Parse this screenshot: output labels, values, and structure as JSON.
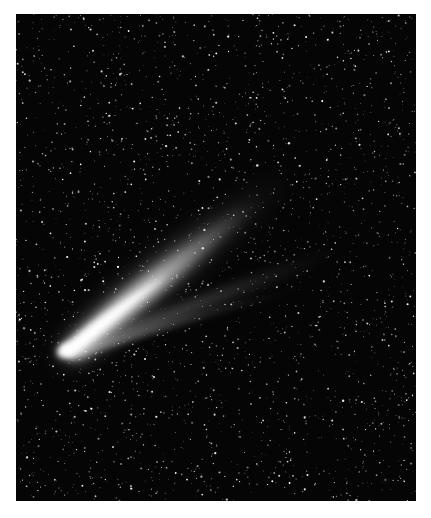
{
  "image": {
    "subject": "Comet with bright nucleus and two diverging tails against a dense star field",
    "background_color": "#050505",
    "frame_color": "#ffffff",
    "tail_color": "#f4f4f4"
  }
}
